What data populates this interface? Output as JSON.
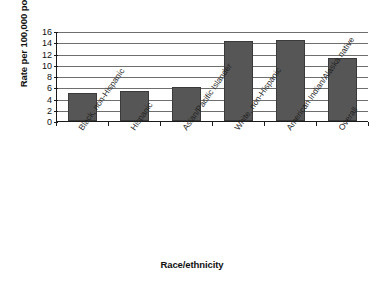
{
  "chart_data": {
    "type": "bar",
    "title": "",
    "xlabel": "Race/ethnicity",
    "ylabel": "Rate per 100,000 population",
    "categories": [
      "Black, non-Hispanic",
      "Hispanic",
      "Asian/Pacific Islander",
      "White, non-Hispanic",
      "American Indian/Alaska native",
      "Overall"
    ],
    "values": [
      5.0,
      5.3,
      6.0,
      14.2,
      14.4,
      11.2
    ],
    "ylim": [
      0,
      16
    ],
    "yticks": [
      0,
      2,
      4,
      6,
      8,
      10,
      12,
      14,
      16
    ],
    "ytick_labels": [
      "0",
      "2",
      "4",
      "6",
      "8",
      "10",
      "12",
      "14",
      "16"
    ],
    "grid": true,
    "legend": false,
    "legend_position": "none",
    "series": [
      {
        "name": "Rate per 100,000 population",
        "values": [
          5.0,
          5.3,
          6.0,
          14.2,
          14.4,
          11.2
        ]
      }
    ],
    "colors": {
      "bar_fill": "#565656",
      "bar_border": "#3a3a3a",
      "gridline": "#6e6e6e",
      "axis": "#1a1a1a",
      "background": "#ffffff",
      "text": "#111111"
    }
  }
}
